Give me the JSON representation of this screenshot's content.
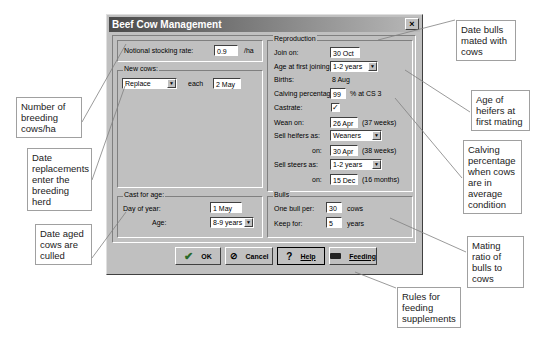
{
  "dialog": {
    "title": "Beef Cow Management",
    "close_label": "×"
  },
  "stocking": {
    "label": "Notional stocking rate:",
    "value": "0.9",
    "unit": "/ha"
  },
  "new_cows": {
    "group_title": "New cows:",
    "mode_value": "Replace",
    "each_label": "each",
    "date_value": "2 May"
  },
  "cast_for_age": {
    "group_title": "Cast for age:",
    "day_label": "Day of year:",
    "day_value": "1 May",
    "age_label": "Age:",
    "age_value": "8-9 years"
  },
  "reproduction": {
    "group_title": "Reproduction",
    "join_label": "Join on:",
    "join_value": "30 Oct",
    "age_first_label": "Age at first joining:",
    "age_first_value": "1-2 years",
    "births_label": "Births:",
    "births_value": "8 Aug",
    "calving_label": "Calving percentage:",
    "calving_value": "99",
    "calving_unit": "% at CS 3",
    "castrate_label": "Castrate:",
    "castrate_checked": "✓",
    "wean_label": "Wean on:",
    "wean_value": "26 Apr",
    "wean_note": "(37 weeks)",
    "sell_heifers_label": "Sell heifers as:",
    "sell_heifers_value": "Weaners",
    "heifers_on_label": "on:",
    "heifers_on_value": "30 Apr",
    "heifers_on_note": "(38 weeks)",
    "sell_steers_label": "Sell steers as:",
    "sell_steers_value": "1-2 years",
    "steers_on_label": "on:",
    "steers_on_value": "15 Dec",
    "steers_on_note": "(16 months)"
  },
  "bulls": {
    "group_title": "Bulls",
    "one_bull_label": "One bull per:",
    "one_bull_value": "30",
    "one_bull_unit": "cows",
    "keep_label": "Keep for:",
    "keep_value": "5",
    "keep_unit": "years"
  },
  "buttons": {
    "ok": "OK",
    "cancel": "Cancel",
    "help": "Help",
    "feeding": "Feeding"
  },
  "callouts": {
    "bulls_date": "Date bulls mated with cows",
    "stocking": "Number of breeding cows/ha",
    "heifer_age": "Age of heifers at first mating",
    "replacements": "Date replacements enter the breeding herd",
    "calving": "Calving percentage when cows are in average condition",
    "culled": "Date aged cows are culled",
    "mating_ratio": "Mating ratio of bulls to cows",
    "feeding_rules": "Rules for feeding supplements"
  }
}
